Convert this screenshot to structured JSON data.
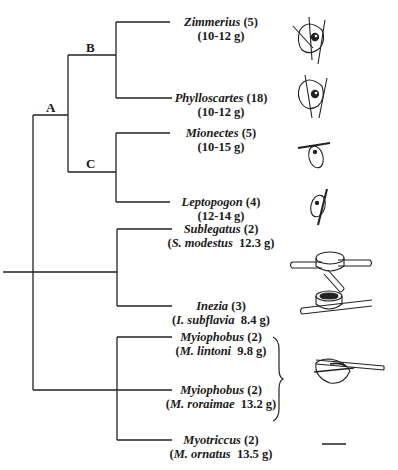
{
  "figure": {
    "type": "phylogenetic-tree-with-nest-illustrations",
    "clade_labels": [
      "A",
      "B",
      "C"
    ],
    "taxa": [
      {
        "genus": "Zimmerius",
        "count": "(5)",
        "mass_line": "(10-12 g)",
        "nest": "pendant-globular-nest"
      },
      {
        "genus": "Phylloscartes",
        "count": "(18)",
        "mass_line": "(10-12 g)",
        "nest": "pendant-globular-nest"
      },
      {
        "genus": "Mionectes",
        "count": "(5)",
        "mass_line": "(10-15 g)",
        "nest": "hanging-pouch-nest"
      },
      {
        "genus": "Leptopogon",
        "count": "(4)",
        "mass_line": "(12-14 g)",
        "nest": "hanging-pouch-nest"
      },
      {
        "genus": "Sublegatus",
        "count": "(2)",
        "mass_prefix": "(",
        "species": "S. modestus",
        "mass": "12.3 g)",
        "nest": "cup-nest-in-fork"
      },
      {
        "genus": "Inezia",
        "count": "(3)",
        "mass_prefix": "(",
        "species": "I. subflavia",
        "mass": "8.4 g)",
        "nest": "cup-nest-on-branch"
      },
      {
        "genus": "Myiophobus",
        "count": "(2)",
        "mass_prefix": "(",
        "species": "M. lintoni",
        "mass": "9.8 g)",
        "nest": "cup-nest-slung-under-branch"
      },
      {
        "genus": "Myiophobus",
        "count": "(2)",
        "mass_prefix": "(",
        "species": "M. roraimae",
        "mass": "13.2 g)",
        "nest": "cup-nest-slung-under-branch"
      },
      {
        "genus": "Myotriccus",
        "count": "(2)",
        "mass_prefix": "(",
        "species": "M. ornatus",
        "mass": "13.5 g)",
        "nest": "unknown-dash"
      }
    ],
    "line_color": "#222222"
  }
}
